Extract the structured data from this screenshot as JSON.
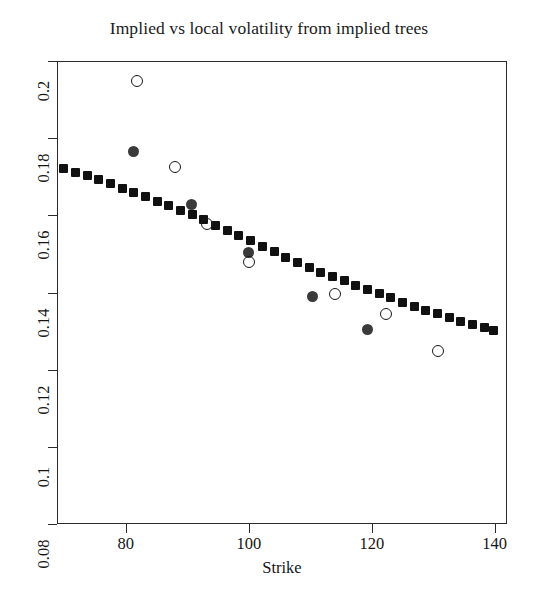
{
  "chart_data": {
    "type": "scatter",
    "title": "Implied vs local volatility from implied trees",
    "xlabel": "Strike",
    "ylabel": "",
    "xlim": [
      68.8,
      142.0
    ],
    "ylim": [
      0.08,
      0.2
    ],
    "xticks": [
      80,
      100,
      120,
      140
    ],
    "xticklabels": [
      "80",
      "100",
      "120",
      "140"
    ],
    "yticks": [
      0.08,
      0.1,
      0.12,
      0.14,
      0.16,
      0.18,
      0.2
    ],
    "yticklabels": [
      "0.08",
      "0.1",
      "0.12",
      "0.14",
      "0.16",
      "0.18",
      "0.2"
    ],
    "grid": false,
    "legend": false,
    "series": [
      {
        "name": "local volatility (filled squares)",
        "marker": "filled-square",
        "color": "#111111",
        "points": [
          {
            "x": 69.9,
            "y": 0.1722
          },
          {
            "x": 71.8,
            "y": 0.1712
          },
          {
            "x": 73.7,
            "y": 0.1703
          },
          {
            "x": 75.6,
            "y": 0.1692
          },
          {
            "x": 77.5,
            "y": 0.1682
          },
          {
            "x": 79.4,
            "y": 0.167
          },
          {
            "x": 81.3,
            "y": 0.1659
          },
          {
            "x": 83.2,
            "y": 0.1648
          },
          {
            "x": 85.1,
            "y": 0.1637
          },
          {
            "x": 87.0,
            "y": 0.1625
          },
          {
            "x": 88.9,
            "y": 0.1613
          },
          {
            "x": 90.8,
            "y": 0.1601
          },
          {
            "x": 92.7,
            "y": 0.1588
          },
          {
            "x": 94.6,
            "y": 0.1574
          },
          {
            "x": 96.5,
            "y": 0.1561
          },
          {
            "x": 98.4,
            "y": 0.1548
          },
          {
            "x": 100.3,
            "y": 0.1535
          },
          {
            "x": 102.2,
            "y": 0.152
          },
          {
            "x": 104.1,
            "y": 0.1505
          },
          {
            "x": 106.0,
            "y": 0.1491
          },
          {
            "x": 107.9,
            "y": 0.1478
          },
          {
            "x": 109.8,
            "y": 0.1466
          },
          {
            "x": 111.7,
            "y": 0.1453
          },
          {
            "x": 113.6,
            "y": 0.1441
          },
          {
            "x": 115.5,
            "y": 0.143
          },
          {
            "x": 117.4,
            "y": 0.1419
          },
          {
            "x": 119.3,
            "y": 0.1408
          },
          {
            "x": 121.2,
            "y": 0.1397
          },
          {
            "x": 123.1,
            "y": 0.1386
          },
          {
            "x": 125.0,
            "y": 0.1375
          },
          {
            "x": 126.9,
            "y": 0.1364
          },
          {
            "x": 128.8,
            "y": 0.1354
          },
          {
            "x": 130.7,
            "y": 0.1345
          },
          {
            "x": 132.6,
            "y": 0.1335
          },
          {
            "x": 134.5,
            "y": 0.1326
          },
          {
            "x": 136.4,
            "y": 0.1317
          },
          {
            "x": 138.3,
            "y": 0.1309
          },
          {
            "x": 139.8,
            "y": 0.1302
          }
        ]
      },
      {
        "name": "implied volatility (filled circles)",
        "marker": "filled-circle",
        "color": "#3a3a3a",
        "points": [
          {
            "x": 81.3,
            "y": 0.1766
          },
          {
            "x": 90.6,
            "y": 0.1629
          },
          {
            "x": 100.0,
            "y": 0.1504
          },
          {
            "x": 110.3,
            "y": 0.139
          },
          {
            "x": 119.3,
            "y": 0.1305
          }
        ]
      },
      {
        "name": "implied volatility (open circles)",
        "marker": "open-circle",
        "color": "#1a1a1a",
        "points": [
          {
            "x": 81.8,
            "y": 0.1948
          },
          {
            "x": 88.0,
            "y": 0.1726
          },
          {
            "x": 93.2,
            "y": 0.1578
          },
          {
            "x": 100.0,
            "y": 0.148
          },
          {
            "x": 114.0,
            "y": 0.1397
          },
          {
            "x": 122.3,
            "y": 0.1343
          },
          {
            "x": 130.7,
            "y": 0.1249
          }
        ]
      }
    ]
  }
}
